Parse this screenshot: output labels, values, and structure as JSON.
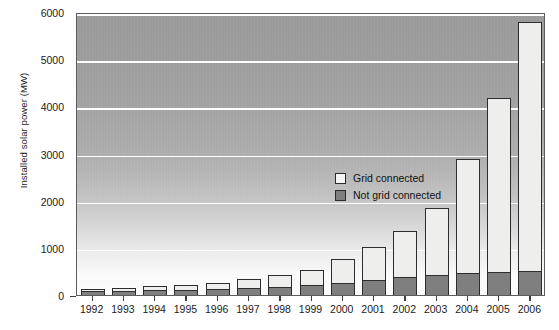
{
  "chart_data": {
    "type": "bar",
    "stacked": true,
    "title": "",
    "subtitle": "",
    "xlabel": "",
    "ylabel": "Installed solar power (MW)",
    "categories": [
      "1992",
      "1993",
      "1994",
      "1995",
      "1996",
      "1997",
      "1998",
      "1999",
      "2000",
      "2001",
      "2002",
      "2003",
      "2004",
      "2005",
      "2006"
    ],
    "series": [
      {
        "name": "Not grid connected",
        "color": "#7f7f7f",
        "values": [
          75,
          85,
          100,
          110,
          125,
          150,
          180,
          215,
          260,
          320,
          380,
          430,
          470,
          490,
          500
        ]
      },
      {
        "name": "Grid connected",
        "color": "#eeeeec",
        "values": [
          55,
          65,
          90,
          110,
          125,
          180,
          250,
          325,
          500,
          700,
          980,
          1420,
          2420,
          3690,
          5280
        ]
      }
    ],
    "totals": [
      130,
      150,
      190,
      220,
      250,
      330,
      430,
      540,
      760,
      1020,
      1360,
      1850,
      2890,
      4180,
      5780
    ],
    "ylim": [
      0,
      6000
    ],
    "yticks": [
      0,
      1000,
      2000,
      3000,
      4000,
      5000,
      6000
    ],
    "ytick_labels": [
      "0",
      "1000",
      "2000",
      "3000",
      "4000",
      "5000",
      "6000"
    ],
    "grid": true,
    "grid_color": "#ffffff",
    "legend_position": "inside-center",
    "legend": [
      {
        "label": "Grid connected",
        "swatch": "#f4f4f2"
      },
      {
        "label": "Not grid connected",
        "swatch": "#7f7f7f"
      }
    ],
    "plot_background": "vertical-gradient-gray-to-white",
    "axis_color": "#5b5b5b",
    "text_color": "#1b1b1b"
  }
}
